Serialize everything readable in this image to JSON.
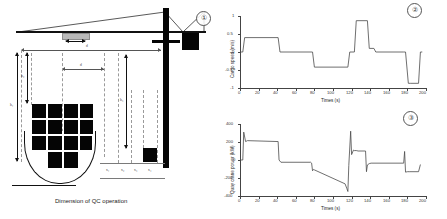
{
  "diagram": {
    "caption": "Dimension of QC operation",
    "badge": "①",
    "labels": {
      "d": "d",
      "d2": "d",
      "h1": "h₁",
      "h2": "h₂",
      "h3": "h₃",
      "x1": "x₁",
      "x2": "x₂",
      "x3": "x₃",
      "x4": "x₄"
    }
  },
  "charts": [
    {
      "badge": "②",
      "chart_data": {
        "type": "line",
        "title": "",
        "xlabel": "Times (s)",
        "ylabel": "Cargo speed (m/s)",
        "xlim": [
          0,
          200
        ],
        "ylim": [
          -1,
          1
        ],
        "xticks": [
          0,
          20,
          40,
          60,
          80,
          100,
          120,
          140,
          160,
          180,
          200
        ],
        "yticks": [
          -1,
          -0.5,
          0,
          0.5,
          1
        ],
        "grid": false,
        "legend": "none",
        "x": [
          0,
          3,
          5,
          41,
          43,
          78,
          80,
          116,
          118,
          123,
          125,
          137,
          139,
          144,
          146,
          176,
          178,
          181,
          183,
          192,
          194,
          196
        ],
        "y": [
          0,
          0,
          0.4,
          0.4,
          0,
          0,
          -0.42,
          -0.42,
          0,
          0,
          0.87,
          0.87,
          0.1,
          0.1,
          0,
          0,
          0,
          -0.87,
          -0.87,
          -0.87,
          0,
          0
        ]
      }
    },
    {
      "badge": "③",
      "chart_data": {
        "type": "line",
        "title": "",
        "xlabel": "Times (s)",
        "ylabel": "Quay crane power (kW)",
        "xlim": [
          0,
          200
        ],
        "ylim": [
          -400,
          400
        ],
        "xticks": [
          0,
          20,
          40,
          60,
          80,
          100,
          120,
          140,
          160,
          180,
          200
        ],
        "yticks": [
          -400,
          -200,
          0,
          200,
          400
        ],
        "grid": false,
        "legend": "none",
        "x": [
          0,
          3,
          4,
          6,
          8,
          41,
          42,
          44,
          76,
          77,
          78,
          79,
          80,
          113,
          115,
          116,
          117,
          119,
          120,
          122,
          123,
          125,
          127,
          135,
          136,
          137,
          139,
          141,
          176,
          177,
          178,
          180,
          182,
          192,
          194
        ],
        "y": [
          0,
          0,
          310,
          205,
          215,
          205,
          0,
          -25,
          -25,
          -35,
          -120,
          -105,
          -110,
          -265,
          -320,
          -350,
          -60,
          320,
          60,
          110,
          105,
          105,
          100,
          100,
          -130,
          -55,
          -40,
          -35,
          -35,
          95,
          -135,
          -130,
          -130,
          -130,
          -50
        ]
      }
    }
  ]
}
